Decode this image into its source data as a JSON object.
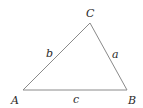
{
  "diagram": {
    "type": "triangle",
    "vertices": [
      {
        "id": "A",
        "label": "A"
      },
      {
        "id": "B",
        "label": "B"
      },
      {
        "id": "C",
        "label": "C"
      }
    ],
    "sides": [
      {
        "id": "a",
        "label": "a",
        "between": [
          "B",
          "C"
        ]
      },
      {
        "id": "b",
        "label": "b",
        "between": [
          "A",
          "C"
        ]
      },
      {
        "id": "c",
        "label": "c",
        "between": [
          "A",
          "B"
        ]
      }
    ],
    "colors": {
      "edge": "#8a8a8a",
      "text": "#2a2a2a"
    }
  }
}
